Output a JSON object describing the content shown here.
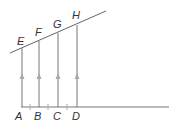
{
  "diagram": {
    "colors": {
      "line": "#777777",
      "arrow": "#aaaaaa",
      "label": "#333333"
    },
    "base_labels": [
      "A",
      "B",
      "C",
      "D"
    ],
    "top_labels": [
      "E",
      "F",
      "G",
      "H"
    ]
  }
}
